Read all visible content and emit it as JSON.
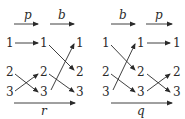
{
  "diagrams": [
    {
      "name": "left",
      "top_arrows": [
        {
          "label": "p"
        },
        {
          "label": "b"
        }
      ],
      "columns": [
        [
          "1",
          "2",
          "3"
        ],
        [
          "1",
          "2",
          "3"
        ],
        [
          "1",
          "2",
          "3"
        ]
      ],
      "bottom_arrow": {
        "label": "r"
      }
    },
    {
      "name": "right",
      "top_arrows": [
        {
          "label": "b"
        },
        {
          "label": "p"
        }
      ],
      "columns": [
        [
          "1",
          "2",
          "3"
        ],
        [
          "1",
          "2",
          "3"
        ],
        [
          "1",
          "2",
          "3"
        ]
      ],
      "bottom_arrow": {
        "label": "q"
      }
    }
  ],
  "colors": {
    "ink": "#2a2a2a"
  }
}
